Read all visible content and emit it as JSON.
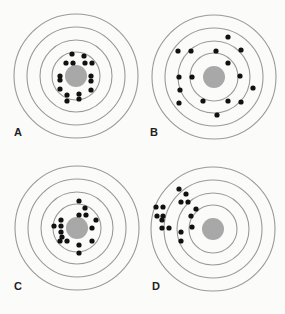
{
  "figure": {
    "colors": {
      "background": "#fbfbfa",
      "ring": "#9a9a9a",
      "bullseye": "#a8a8a8",
      "dot": "#111111",
      "label": "#222222"
    },
    "ring_radii": [
      62,
      49,
      36,
      24
    ],
    "bullseye_radius": 11,
    "dot_radius": 2.6,
    "panels": [
      {
        "label": "A",
        "center": [
          76,
          76
        ],
        "label_pos": [
          14,
          133
        ],
        "dots": [
          [
            72,
            54
          ],
          [
            84,
            56
          ],
          [
            66,
            63
          ],
          [
            73,
            63
          ],
          [
            85,
            63
          ],
          [
            92,
            63
          ],
          [
            60,
            76
          ],
          [
            60,
            80
          ],
          [
            91,
            76
          ],
          [
            91,
            81
          ],
          [
            60,
            89
          ],
          [
            91,
            90
          ],
          [
            67,
            95
          ],
          [
            79,
            94
          ],
          [
            67,
            101
          ],
          [
            79,
            99
          ]
        ]
      },
      {
        "label": "B",
        "center": [
          214,
          77
        ],
        "label_pos": [
          150,
          133
        ],
        "dots": [
          [
            228,
            37
          ],
          [
            178,
            51
          ],
          [
            191,
            51
          ],
          [
            216,
            51
          ],
          [
            241,
            50
          ],
          [
            228,
            63
          ],
          [
            179,
            77
          ],
          [
            192,
            77
          ],
          [
            240,
            76
          ],
          [
            253,
            88
          ],
          [
            180,
            90
          ],
          [
            179,
            103
          ],
          [
            203,
            101
          ],
          [
            228,
            101
          ],
          [
            241,
            102
          ],
          [
            217,
            115
          ]
        ]
      },
      {
        "label": "C",
        "center": [
          77,
          228
        ],
        "label_pos": [
          14,
          287
        ],
        "dots": [
          [
            79,
            201
          ],
          [
            85,
            208
          ],
          [
            79,
            215
          ],
          [
            86,
            215
          ],
          [
            61,
            220
          ],
          [
            54,
            226
          ],
          [
            61,
            226
          ],
          [
            96,
            220
          ],
          [
            61,
            232
          ],
          [
            62,
            237
          ],
          [
            92,
            228
          ],
          [
            60,
            241
          ],
          [
            67,
            241
          ],
          [
            92,
            241
          ],
          [
            79,
            245
          ],
          [
            79,
            253
          ]
        ]
      },
      {
        "label": "D",
        "center": [
          213,
          229
        ],
        "label_pos": [
          152,
          287
        ],
        "dots": [
          [
            179,
            189
          ],
          [
            186,
            194
          ],
          [
            181,
            202
          ],
          [
            188,
            202
          ],
          [
            156,
            207
          ],
          [
            163,
            207
          ],
          [
            196,
            209
          ],
          [
            157,
            216
          ],
          [
            163,
            216
          ],
          [
            162,
            220
          ],
          [
            191,
            216
          ],
          [
            162,
            228
          ],
          [
            169,
            228
          ],
          [
            192,
            227
          ],
          [
            181,
            232
          ],
          [
            181,
            241
          ]
        ]
      }
    ]
  }
}
